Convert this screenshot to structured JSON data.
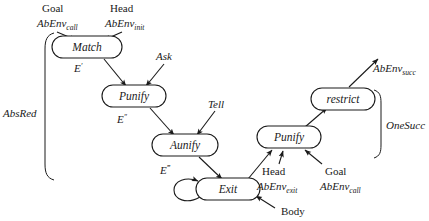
{
  "diagram": {
    "background_color": "#ffffff",
    "ink_color": "#1a1a1a",
    "width": 429,
    "height": 221,
    "nodes": [
      {
        "id": "match",
        "label": "Match",
        "x": 87,
        "y": 47,
        "w": 70,
        "h": 22
      },
      {
        "id": "punify_l",
        "label": "Punify",
        "x": 134,
        "y": 96,
        "w": 64,
        "h": 22
      },
      {
        "id": "aunify",
        "label": "Aunify",
        "x": 185,
        "y": 145,
        "w": 66,
        "h": 22
      },
      {
        "id": "exit",
        "label": "Exit",
        "x": 228,
        "y": 189,
        "w": 64,
        "h": 22
      },
      {
        "id": "punify_r",
        "label": "Punify",
        "x": 289,
        "y": 137,
        "w": 64,
        "h": 22
      },
      {
        "id": "restrict",
        "label": "restrict",
        "x": 343,
        "y": 99,
        "w": 64,
        "h": 22
      }
    ],
    "edge_labels": [
      {
        "id": "e1",
        "text": "E",
        "sup": "′",
        "x": 80,
        "y": 68
      },
      {
        "id": "e2",
        "text": "E",
        "sup": "″",
        "x": 123,
        "y": 119
      },
      {
        "id": "e3",
        "text": "E",
        "sup": "‴",
        "x": 165,
        "y": 170
      },
      {
        "id": "ask",
        "text": "Ask",
        "sup": "",
        "x": 156,
        "y": 60
      },
      {
        "id": "tell",
        "text": "Tell",
        "sup": "",
        "x": 208,
        "y": 107
      }
    ],
    "io_labels": [
      {
        "id": "goal-call-top",
        "line1": "Goal",
        "line2_base": "AbEnv",
        "line2_sub": "call",
        "x": 42,
        "y": 13,
        "align": "left"
      },
      {
        "id": "head-init-top",
        "line1": "Head",
        "line2_base": "AbEnv",
        "line2_sub": "init",
        "x": 110,
        "y": 13,
        "align": "left"
      },
      {
        "id": "head-exit-bot",
        "line1": "Head",
        "line2_base": "AbEnv",
        "line2_sub": "exit",
        "x": 262,
        "y": 175,
        "align": "left"
      },
      {
        "id": "goal-call-bot",
        "line1": "Goal",
        "line2_base": "AbEnv",
        "line2_sub": "call",
        "x": 325,
        "y": 175,
        "align": "left"
      }
    ],
    "single_labels": [
      {
        "id": "body",
        "text": "Body",
        "x": 281,
        "y": 214,
        "italic": false,
        "sub": ""
      },
      {
        "id": "abenv-succ",
        "text": "AbEnv",
        "x": 373,
        "y": 72,
        "italic": true,
        "sub": "succ"
      }
    ],
    "braces": [
      {
        "id": "absred",
        "label": "AbsRed",
        "label_x": 3,
        "label_y": 113,
        "x": 45,
        "y_top": 33,
        "y_bottom": 180,
        "side": "left"
      },
      {
        "id": "onesucc",
        "label": "OneSucc",
        "label_x": 388,
        "label_y": 126,
        "x": 381,
        "y_top": 90,
        "y_bottom": 158,
        "side": "right"
      }
    ],
    "edges": [
      {
        "id": "goal-to-match",
        "from": "Goal AbEnv_call label",
        "to": "Match"
      },
      {
        "id": "head-to-match",
        "from": "Head AbEnv_init label",
        "to": "Match"
      },
      {
        "id": "match-to-punify-l",
        "from": "Match",
        "to": "Punify (left)",
        "label": "E′"
      },
      {
        "id": "ask-to-punify-l",
        "from": "Ask",
        "to": "Punify (left)"
      },
      {
        "id": "punify-l-to-aunify",
        "from": "Punify (left)",
        "to": "Aunify",
        "label": "E″"
      },
      {
        "id": "tell-to-aunify",
        "from": "Tell",
        "to": "Aunify"
      },
      {
        "id": "aunify-to-exit",
        "from": "Aunify",
        "to": "Exit",
        "label": "E‴"
      },
      {
        "id": "exit-self-loop",
        "from": "Exit",
        "to": "Exit"
      },
      {
        "id": "body-to-exit",
        "from": "Body",
        "to": "Exit"
      },
      {
        "id": "exit-to-punify-r",
        "from": "Exit",
        "to": "Punify (right)"
      },
      {
        "id": "head-exit-to-punify-r",
        "from": "Head AbEnv_exit label",
        "to": "Punify (right)"
      },
      {
        "id": "goal-call-to-punify-r",
        "from": "Goal AbEnv_call label",
        "to": "Punify (right)"
      },
      {
        "id": "punify-r-to-restrict",
        "from": "Punify (right)",
        "to": "restrict"
      },
      {
        "id": "restrict-to-succ",
        "from": "restrict",
        "to": "AbEnv_succ"
      }
    ]
  }
}
